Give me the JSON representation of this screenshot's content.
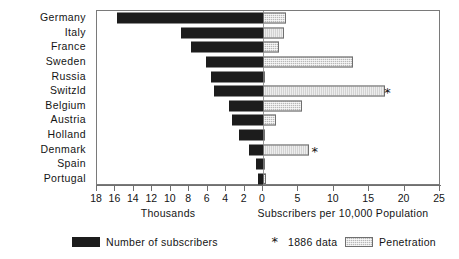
{
  "chart_data": {
    "type": "bar",
    "title": "",
    "subtitle": "",
    "orientation": "horizontal",
    "grid": false,
    "categories": [
      "Germany",
      "Italy",
      "France",
      "Sweden",
      "Russia",
      "Switzld",
      "Belgium",
      "Austria",
      "Holland",
      "Denmark",
      "Spain",
      "Portugal"
    ],
    "series": [
      {
        "name": "Number of subscribers",
        "unit": "Thousands",
        "axis": "left",
        "direction": "left",
        "color": "#1c1c1c",
        "values": [
          15.8,
          8.9,
          7.8,
          6.2,
          5.6,
          5.3,
          3.7,
          3.4,
          2.6,
          1.5,
          0.8,
          0.5
        ]
      },
      {
        "name": "Penetration",
        "unit": "Subscribers per 10,000 Population",
        "axis": "right",
        "direction": "right",
        "color": "#b8b8b8",
        "values": [
          3.2,
          3.0,
          2.2,
          12.7,
          0.3,
          17.3,
          5.5,
          1.8,
          0.2,
          6.5,
          0.3,
          0.4
        ]
      }
    ],
    "markers": {
      "name": "1886 data",
      "symbol": "*",
      "categories": [
        "Switzld",
        "Denmark"
      ],
      "values": [
        17.6,
        7.3
      ]
    },
    "left_axis": {
      "label": "Thousands",
      "ticks": [
        18,
        16,
        14,
        12,
        10,
        8,
        6,
        4,
        2,
        0
      ],
      "tick_labels": [
        "18",
        "16",
        "14",
        "12",
        "10",
        "8",
        "6",
        "4",
        "2",
        "0"
      ],
      "range": [
        18,
        0
      ],
      "reversed": true
    },
    "right_axis": {
      "label": "Subscribers per 10,000 Population",
      "ticks": [
        0,
        5,
        10,
        15,
        20,
        25
      ],
      "tick_labels": [
        "0",
        "5",
        "10",
        "15",
        "20",
        "25"
      ],
      "range": [
        0,
        25
      ]
    },
    "legend": {
      "position": "bottom",
      "entries": [
        {
          "label": "Number of subscribers",
          "swatch": "dark-solid"
        },
        {
          "label": "1886 data",
          "swatch": "asterisk"
        },
        {
          "label": "Penetration",
          "swatch": "grey-hatched"
        }
      ]
    }
  }
}
